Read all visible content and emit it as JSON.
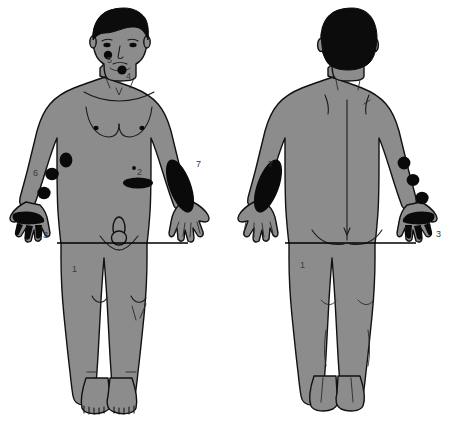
{
  "figure": {
    "views": [
      "anterior",
      "posterior"
    ],
    "palette": {
      "skin": "#8c8c8c",
      "lesion": "#0a0a0a",
      "hair": "#0c0c0c",
      "outline": "#111111",
      "background": "#ffffff",
      "label": "#3a3a3a"
    }
  },
  "anterior": {
    "view_label": "anterior",
    "reference_line": {
      "label": "1",
      "description": "horizontal hip reference line"
    },
    "lesions": [
      {
        "label": "5",
        "site": "left cheek",
        "shape": "round",
        "count": 1
      },
      {
        "label": "4",
        "site": "chin / submental",
        "shape": "round",
        "count": 1
      },
      {
        "label": "2",
        "site": "lower abdomen",
        "shape": "oval",
        "count": 1
      },
      {
        "label": "6",
        "site": "right forearm",
        "shape": "round",
        "count": 3
      },
      {
        "label": "3",
        "site": "right hand and fingers",
        "shape": "irregular",
        "count": 1
      },
      {
        "label": "7",
        "site": "left forearm",
        "shape": "elongated oval",
        "count": 1
      }
    ],
    "labels": [
      "5",
      "4",
      "2",
      "6",
      "3",
      "7",
      "1"
    ]
  },
  "posterior": {
    "view_label": "posterior",
    "reference_line": {
      "label": "1",
      "description": "horizontal hip reference line"
    },
    "lesions": [
      {
        "label": "7",
        "site": "right forearm (dorsal)",
        "shape": "elongated oval",
        "count": 1
      },
      {
        "label": "3",
        "site": "left hand and fingers (dorsal)",
        "shape": "irregular",
        "count": 1
      },
      {
        "label": "",
        "site": "left forearm (dorsal)",
        "shape": "round",
        "count": 3
      }
    ],
    "labels": [
      "7",
      "3",
      "1"
    ]
  }
}
